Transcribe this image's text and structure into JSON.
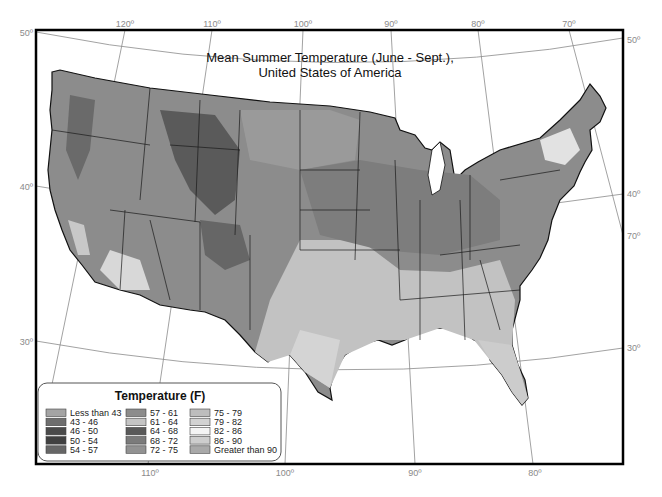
{
  "map": {
    "title_line1": "Mean Summer Temperature (June - Sept.),",
    "title_line2": "United States of America",
    "longitude_labels_top": [
      "120º",
      "110º",
      "100º",
      "90º",
      "80º",
      "70º"
    ],
    "longitude_labels_bottom": [
      "110º",
      "100º",
      "90º",
      "80º"
    ],
    "latitude_labels_left": [
      "50º",
      "40º",
      "30º"
    ],
    "latitude_labels_right": [
      "50º",
      "40º",
      "30º"
    ],
    "longitude_label_right_extra": "70º"
  },
  "legend": {
    "title": "Temperature (F)",
    "items": [
      {
        "label": "Less than 43",
        "color": "#a4a4a4"
      },
      {
        "label": "43 - 46",
        "color": "#6e6e6e"
      },
      {
        "label": "46 - 50",
        "color": "#4a4a4a"
      },
      {
        "label": "50 - 54",
        "color": "#404040"
      },
      {
        "label": "54 - 57",
        "color": "#666666"
      },
      {
        "label": "57 - 61",
        "color": "#8c8c8c"
      },
      {
        "label": "61 - 64",
        "color": "#c4c4c4"
      },
      {
        "label": "64 - 68",
        "color": "#595959"
      },
      {
        "label": "68 - 72",
        "color": "#7b7b7b"
      },
      {
        "label": "72 - 75",
        "color": "#929292"
      },
      {
        "label": "75 - 79",
        "color": "#bdbdbd"
      },
      {
        "label": "79 - 82",
        "color": "#d2d2d2"
      },
      {
        "label": "82 - 86",
        "color": "#f4f4f4"
      },
      {
        "label": "86 - 90",
        "color": "#cdcdcd"
      },
      {
        "label": "Greater than 90",
        "color": "#a9a9a9"
      }
    ]
  }
}
